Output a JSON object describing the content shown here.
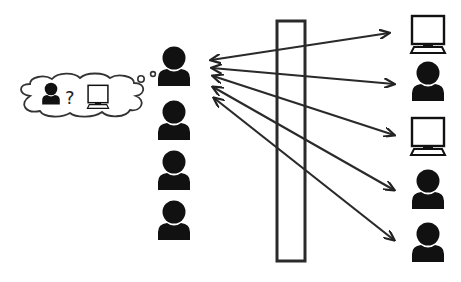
{
  "diagram": {
    "title": "",
    "colors": {
      "ink": "#111111",
      "stroke": "#333333",
      "background": "#ffffff"
    },
    "thought_bubble": {
      "contents": [
        "person-icon",
        "question-mark",
        "monitor-icon"
      ],
      "question_text": "?"
    },
    "left_column": {
      "items": [
        "person",
        "person",
        "person",
        "person"
      ]
    },
    "barrier": {
      "shape": "tall-rectangle"
    },
    "right_column": {
      "items": [
        "monitor",
        "person",
        "monitor",
        "person",
        "person"
      ]
    },
    "arrows": {
      "count": 5,
      "direction": "bidirectional",
      "from": "left_column.items.0",
      "to": [
        "right_column.items.0",
        "right_column.items.1",
        "right_column.items.2",
        "right_column.items.3",
        "right_column.items.4"
      ]
    }
  }
}
